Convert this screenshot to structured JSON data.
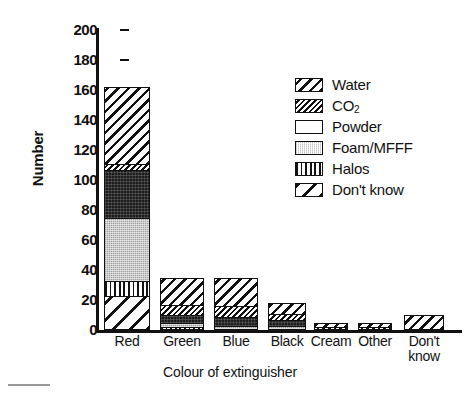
{
  "chart_data": {
    "type": "bar",
    "title": "",
    "subtitle": "",
    "xlabel": "Colour of extinguisher",
    "ylabel": "Number",
    "stacked": true,
    "grid": false,
    "legend_position": "upper-right",
    "ylim": [
      0,
      200
    ],
    "ytick_values": [
      0,
      20,
      40,
      60,
      80,
      100,
      120,
      140,
      160,
      180,
      200
    ],
    "ytick_labels": [
      "0",
      "20",
      "40",
      "60",
      "80",
      "100",
      "120",
      "140",
      "160",
      "180",
      "200"
    ],
    "categories": [
      "Red",
      "Green",
      "Blue",
      "Black",
      "Cream",
      "Other",
      "Don't know"
    ],
    "category_label_lines": [
      [
        "Red"
      ],
      [
        "Green"
      ],
      [
        "Blue"
      ],
      [
        "Black"
      ],
      [
        "Cream"
      ],
      [
        "Other"
      ],
      [
        "Don't",
        "know"
      ]
    ],
    "series": [
      {
        "name": "Water",
        "pattern": "wide-diagonal-hatch",
        "values": [
          51,
          18,
          19,
          7,
          3,
          3,
          10
        ]
      },
      {
        "name": "CO2",
        "pattern": "narrow-diagonal-hatch",
        "values": [
          4,
          7,
          7,
          4,
          2,
          2,
          0
        ]
      },
      {
        "name": "Powder",
        "pattern": "dark-solid",
        "values": [
          32,
          5,
          6,
          4,
          0,
          0,
          0
        ]
      },
      {
        "name": "Foam/MFFF",
        "pattern": "light-gray",
        "values": [
          42,
          3,
          2,
          3,
          0,
          0,
          0
        ]
      },
      {
        "name": "Halos",
        "pattern": "vertical-lines",
        "values": [
          10,
          2,
          1,
          0,
          0,
          0,
          0
        ]
      },
      {
        "name": "Don't know",
        "pattern": "sparse-diagonal-hatch",
        "values": [
          23,
          0,
          0,
          0,
          0,
          0,
          0
        ]
      }
    ],
    "totals": [
      162,
      35,
      35,
      18,
      5,
      5,
      10
    ]
  },
  "legend": {
    "items": [
      {
        "label": "Water",
        "label_sub": ""
      },
      {
        "label": "CO",
        "label_sub": "2"
      },
      {
        "label": "Powder",
        "label_sub": ""
      },
      {
        "label": "Foam/MFFF",
        "label_sub": ""
      },
      {
        "label": "Halos",
        "label_sub": ""
      },
      {
        "label": "Don't know",
        "label_sub": ""
      }
    ]
  },
  "colors": {
    "ink": "#111111",
    "background": "#ffffff",
    "powder": "#1d1d1d",
    "foam": "#c9c9c9"
  }
}
